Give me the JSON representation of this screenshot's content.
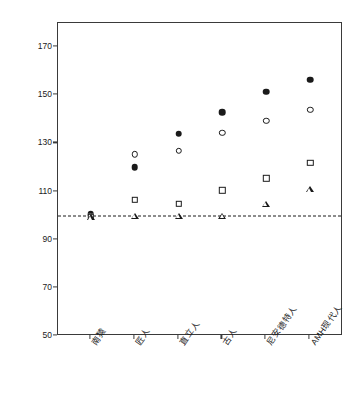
{
  "chart_data": {
    "type": "scatter",
    "title": "",
    "xlabel": "",
    "ylabel": "总时间分配 (%)",
    "ylim": [
      50,
      180
    ],
    "yticks": [
      50,
      70,
      90,
      110,
      130,
      150,
      170
    ],
    "ytick_labels": [
      "50",
      "70",
      "90",
      "110",
      "130",
      "150",
      "170"
    ],
    "grid": false,
    "legend": "none",
    "categories": [
      "南猿",
      "匠人",
      "直立人",
      "古人",
      "尼安德特人",
      "AMH现代人"
    ],
    "reference_line": {
      "value": 100,
      "style": "dashed",
      "color": "#1a1a1a"
    },
    "series": [
      {
        "name": "filled-circle",
        "marker": "filled-circle",
        "color": "#1a1a1a",
        "values": [
          100.5,
          120.0,
          134.0,
          143.0,
          151.5,
          156.5
        ]
      },
      {
        "name": "open-circle",
        "marker": "open-circle",
        "color": "#1a1a1a",
        "values": [
          100.0,
          125.5,
          127.0,
          134.5,
          139.5,
          144.0
        ]
      },
      {
        "name": "open-square",
        "marker": "open-square",
        "color": "#1a1a1a",
        "values": [
          99.5,
          106.5,
          105.0,
          110.5,
          115.5,
          122.0
        ]
      },
      {
        "name": "open-triangle",
        "marker": "open-triangle",
        "color": "#1a1a1a",
        "values": [
          99.5,
          100.0,
          100.0,
          100.0,
          105.0,
          111.0
        ]
      }
    ]
  },
  "figure": {
    "background": "#ffffff",
    "axis_color": "#3a3a3a",
    "text_color": "#1a1a1a"
  }
}
